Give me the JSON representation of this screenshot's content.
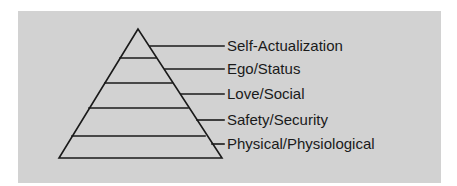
{
  "diagram": {
    "type": "pyramid",
    "background_color": "#d2d2d2",
    "line_color": "#1a1a1a",
    "levels_top_to_bottom": [
      {
        "label": "Self-Actualization"
      },
      {
        "label": "Ego/Status"
      },
      {
        "label": "Love/Social"
      },
      {
        "label": "Safety/Security"
      },
      {
        "label": "Physical/Physiological"
      }
    ]
  }
}
